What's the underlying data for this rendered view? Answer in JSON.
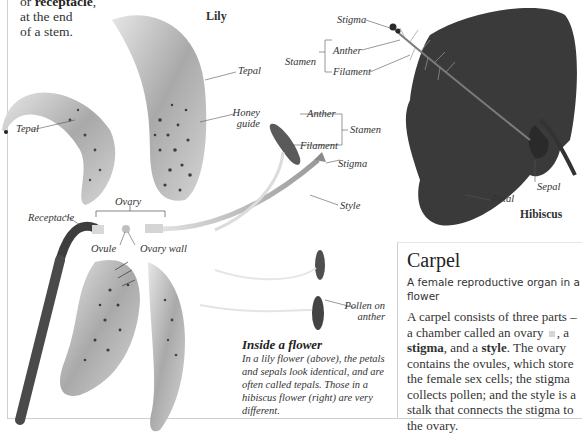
{
  "intro": {
    "line1_prefix": "or ",
    "line1_bold": "receptacle",
    "line1_suffix": ",",
    "line2": "at the end",
    "line3": "of a stem."
  },
  "titles": {
    "lily": "Lily",
    "hibiscus": "Hibiscus"
  },
  "labels": {
    "tepal_left": "Tepal",
    "tepal_right": "Tepal",
    "honey_guide_1": "Honey",
    "honey_guide_2": "guide",
    "stigma_hibiscus": "Stigma",
    "anther_hibiscus": "Anther",
    "stamen_hibiscus": "Stamen",
    "filament_hibiscus": "Filament",
    "anther_lily": "Anther",
    "filament_lily": "Filament",
    "stamen_lily": "Stamen",
    "stigma_lily": "Stigma",
    "style": "Style",
    "ovary": "Ovary",
    "receptacle": "Receptacle",
    "ovule": "Ovule",
    "ovary_wall": "Ovary wall",
    "pollen_1": "Pollen on",
    "pollen_2": "anther",
    "petal": "Petal",
    "sepal": "Sepal"
  },
  "inside": {
    "title": "Inside a flower",
    "body": "In a lily flower (above), the petals and sepals look identical, and are often called tepals. Those in a hibiscus flower (right) are very different."
  },
  "carpel": {
    "title": "Carpel",
    "subtitle": "A female reproductive organ in a flower",
    "body_1": "A carpel consists of three parts – a chamber called an ovary",
    "body_2": ", a ",
    "body_stigma": "stigma",
    "body_3": ", and a ",
    "body_style": "style",
    "body_4": ". The ovary contains the ovules, which store the female sex cells; the stigma collects pollen; and the style is a stalk that connects the stigma to the ovary.",
    "swatch_color": "#d6d6d6"
  },
  "colors": {
    "hibiscus": "#3a3a3a",
    "lily_tepal": "#b8b8b8",
    "spots": "#3c3c3c",
    "frame": "#cfcfcf"
  }
}
